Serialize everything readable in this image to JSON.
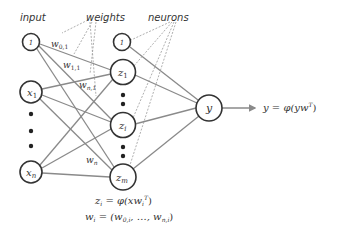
{
  "labels": {
    "input": "input",
    "weights": "weights",
    "neurons": "neurons"
  },
  "input_nodes": {
    "bias": "1",
    "x1": "x",
    "x1_sub": "1",
    "xn": "x",
    "xn_sub": "n"
  },
  "hidden_nodes": {
    "bias": "1",
    "z1": "z",
    "z1_sub": "1",
    "zi": "z",
    "zi_sub": "i",
    "zm": "z",
    "zm_sub": "m"
  },
  "output_node": {
    "label": "y"
  },
  "weight_labels": {
    "w01": "w",
    "w01_sub": "0,1",
    "w11": "w",
    "w11_sub": "1,1",
    "wn1": "w",
    "wn1_sub": "n,1",
    "wn": "w",
    "wn_sub": "n"
  },
  "equations": {
    "output": "y = φ(yw",
    "output_sup": "T",
    "output_close": ")",
    "hidden": "z",
    "hidden_sub": "i",
    "hidden_rhs": " = φ(xw",
    "hidden_rhs_sub": "i",
    "hidden_rhs_sup": "T",
    "hidden_close": ")",
    "weights_vec": "w",
    "weights_vec_sub": "i",
    "weights_vec_rhs": " = (w",
    "weights_vec_rhs_sub0": "0,i",
    "weights_vec_mid": ", …, w",
    "weights_vec_rhs_subn": "n,i",
    "weights_vec_close": ")"
  },
  "colors": {
    "edge": "#8a8a8a",
    "node_stroke": "#333333",
    "text": "#333333"
  }
}
